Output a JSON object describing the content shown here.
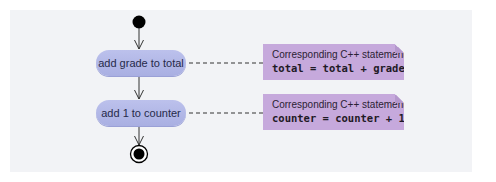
{
  "diagram": {
    "type": "UML activity diagram",
    "colors": {
      "panel_background": "#f2f3f6",
      "action_fill": "#b3b8e8",
      "note_fill": "#c6a9dc",
      "line": "#333333",
      "start_end": "#000000"
    },
    "nodes": {
      "initial": {
        "kind": "initial-state"
      },
      "actions": [
        {
          "id": "action-1",
          "label": "add grade to total"
        },
        {
          "id": "action-2",
          "label": "add 1 to counter"
        }
      ],
      "final": {
        "kind": "final-state"
      }
    },
    "notes": [
      {
        "attached_to": "action-1",
        "caption": "Corresponding C++ statement:",
        "code": "total = total + grade;"
      },
      {
        "attached_to": "action-2",
        "caption": "Corresponding C++ statement:",
        "code": "counter = counter + 1;"
      }
    ],
    "transitions": [
      {
        "from": "initial",
        "to": "action-1"
      },
      {
        "from": "action-1",
        "to": "action-2"
      },
      {
        "from": "action-2",
        "to": "final"
      }
    ]
  }
}
